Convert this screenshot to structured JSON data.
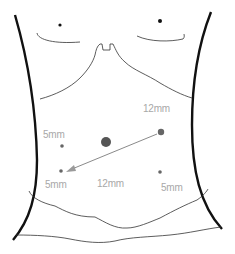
{
  "diagram": {
    "type": "abdominal trocar port placement",
    "colors": {
      "outline": "#111111",
      "skin_lines": "#333333",
      "port": "#666666",
      "arrow": "#8a8a8a",
      "label": "#a8a8a8"
    },
    "ports": [
      {
        "id": "umbilical",
        "x": 106,
        "y": 142,
        "r": 5,
        "label": ""
      },
      {
        "id": "right-upper",
        "x": 161,
        "y": 132,
        "r": 3.2,
        "label": "12mm"
      },
      {
        "id": "left-upper",
        "x": 62,
        "y": 146,
        "r": 2,
        "label": "5mm"
      },
      {
        "id": "left-lower",
        "x": 61,
        "y": 171,
        "r": 2,
        "label": "5mm"
      },
      {
        "id": "right-lower",
        "x": 160,
        "y": 172,
        "r": 2,
        "label": "5mm"
      }
    ],
    "labels": [
      {
        "id": "label-12mm-upper-right",
        "text": "12mm",
        "x": 143,
        "y": 104
      },
      {
        "id": "label-5mm-upper-left",
        "text": "5mm",
        "x": 43,
        "y": 130
      },
      {
        "id": "label-5mm-lower-left",
        "text": "5mm",
        "x": 45,
        "y": 180
      },
      {
        "id": "label-12mm-center",
        "text": "12mm",
        "x": 97,
        "y": 179
      },
      {
        "id": "label-5mm-lower-right",
        "text": "5mm",
        "x": 161,
        "y": 183
      }
    ],
    "arrow": {
      "from": "right-upper",
      "to": "left-lower",
      "x1": 157,
      "y1": 134,
      "x2": 67,
      "y2": 171
    }
  }
}
